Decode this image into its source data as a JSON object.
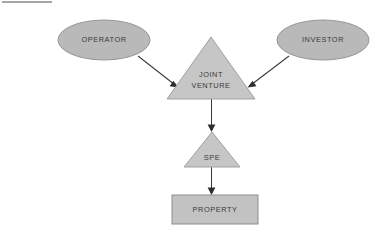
{
  "diagram": {
    "background_color": "#ffffff",
    "top_rule": {
      "present": true,
      "x1": 2,
      "y1": 2,
      "x2": 52,
      "y2": 2,
      "color": "#8a8a8a"
    },
    "colors": {
      "ellipse_fill": "#b9b9b9",
      "ellipse_stroke": "#8f8f8f",
      "triangle_fill": "#c6c6c6",
      "triangle_stroke": "#9a9a9a",
      "rect_fill": "#c2c2c2",
      "rect_stroke": "#8d8d8d",
      "connector": "#3b3b3b",
      "label_text": "#3a3a3a"
    },
    "nodes": [
      {
        "id": "operator",
        "label": "OPERATOR",
        "shape": "ellipse",
        "cx": 104,
        "cy": 40,
        "rx": 46,
        "ry": 20
      },
      {
        "id": "investor",
        "label": "INVESTOR",
        "shape": "ellipse",
        "cx": 323,
        "cy": 40,
        "rx": 46,
        "ry": 20
      },
      {
        "id": "joint-venture",
        "label": "JOINT VENTURE",
        "label_line1": "JOINT",
        "label_line2": "VENTURE",
        "shape": "triangle",
        "apex_x": 211,
        "apex_y": 37,
        "left_x": 167,
        "right_x": 255,
        "base_y": 99
      },
      {
        "id": "spe",
        "label": "SPE",
        "shape": "triangle",
        "apex_x": 212,
        "apex_y": 132,
        "left_x": 184,
        "right_x": 240,
        "base_y": 167
      },
      {
        "id": "property",
        "label": "PROPERTY",
        "shape": "rectangle",
        "x": 172,
        "y": 195,
        "width": 86,
        "height": 29
      }
    ],
    "edges": [
      {
        "id": "operator-to-jv",
        "from": "operator",
        "to": "joint-venture",
        "x1": 138,
        "y1": 56,
        "x2": 177,
        "y2": 86,
        "arrow": "end"
      },
      {
        "id": "investor-to-jv",
        "from": "investor",
        "to": "joint-venture",
        "x1": 289,
        "y1": 56,
        "x2": 248,
        "y2": 86,
        "arrow": "end"
      },
      {
        "id": "jv-to-spe",
        "from": "joint-venture",
        "to": "spe",
        "x1": 212,
        "y1": 99,
        "x2": 212,
        "y2": 130,
        "arrow": "end"
      },
      {
        "id": "spe-to-property",
        "from": "spe",
        "to": "property",
        "x1": 212,
        "y1": 167,
        "x2": 212,
        "y2": 194,
        "arrow": "end"
      }
    ]
  }
}
